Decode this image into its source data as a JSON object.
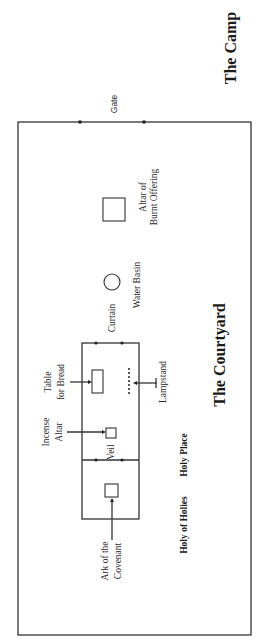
{
  "diagram": {
    "title_outer": "The Camp",
    "title_courtyard": "The Courtyard",
    "labels": {
      "gate": "Gate",
      "altar_burnt_line1": "Altar of",
      "altar_burnt_line2": "Burnt Offering",
      "water_basin": "Water Basin",
      "curtain": "Curtain",
      "table_line1": "Table",
      "table_line2": "for Bread",
      "lampstand": "Lampstand",
      "incense_line1": "Incense",
      "incense_line2": "Altar",
      "veil": "Veil",
      "ark_line1": "Ark of the",
      "ark_line2": "Covenant",
      "holy_place": "Holy Place",
      "holy_of_holies": "Holy of Holies"
    },
    "colors": {
      "stroke": "#333333",
      "text": "#2a2a2a",
      "background": "#ffffff"
    }
  }
}
